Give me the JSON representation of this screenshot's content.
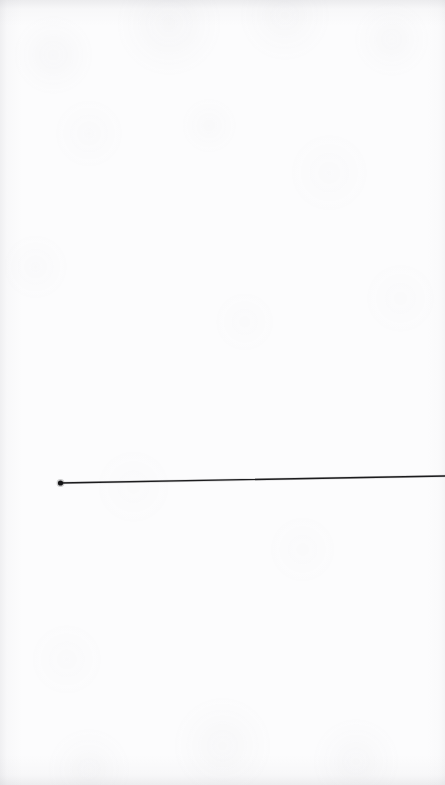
{
  "canvas": {
    "width": 445,
    "height": 785,
    "background_color": "#fcfcfd",
    "paper_tone": "#fbfbfc",
    "texture_label": "paper-grain",
    "description": "Blank off-white paper sheet with a single hand-drawn straight line"
  },
  "chart_data": {
    "type": "line",
    "title": "",
    "subtitle": "",
    "xlabel": "",
    "ylabel": "",
    "grid": false,
    "legend": null,
    "tick_labels": [],
    "annotations": [],
    "xlim": [
      0,
      445
    ],
    "ylim": [
      785,
      0
    ],
    "series": [
      {
        "name": "stroke",
        "color": "#1c1c1e",
        "stroke_width": 1.3,
        "marker": "dot",
        "marker_color": "#141416",
        "marker_radius": 2.6,
        "marker_at": "start",
        "points": [
          {
            "x": 60,
            "y": 483
          },
          {
            "x": 445,
            "y": 476
          }
        ]
      }
    ]
  },
  "elements": {
    "line": {
      "name": "straight-line",
      "color": "#1c1c1e",
      "x1": 60,
      "y1": 483,
      "x2": 446,
      "y2": 476,
      "width": 1.3
    },
    "endpoint_dot": {
      "name": "endpoint-dot",
      "color": "#141416",
      "cx": 60.5,
      "cy": 483,
      "r": 2.6
    }
  }
}
